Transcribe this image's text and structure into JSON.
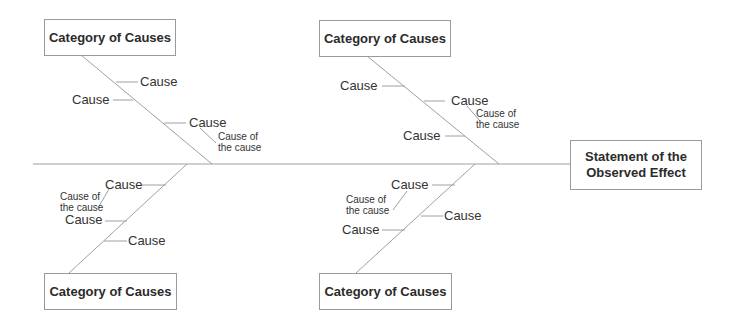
{
  "diagram": {
    "type": "fishbone",
    "effect": {
      "line1": "Statement of the",
      "line2": "Observed Effect"
    },
    "categories": [
      {
        "position": "top-left",
        "label": "Category of Causes",
        "causes": [
          "Cause",
          "Cause",
          "Cause"
        ],
        "sub_cause": {
          "line1": "Cause of",
          "line2": "the cause"
        }
      },
      {
        "position": "top-right",
        "label": "Category of Causes",
        "causes": [
          "Cause",
          "Cause",
          "Cause"
        ],
        "sub_cause": {
          "line1": "Cause of",
          "line2": "the cause"
        }
      },
      {
        "position": "bottom-left",
        "label": "Category of Causes",
        "causes": [
          "Cause",
          "Cause",
          "Cause"
        ],
        "sub_cause": {
          "line1": "Cause of",
          "line2": "the cause"
        }
      },
      {
        "position": "bottom-right",
        "label": "Category of Causes",
        "causes": [
          "Cause",
          "Cause",
          "Cause"
        ],
        "sub_cause": {
          "line1": "Cause of",
          "line2": "the cause"
        }
      }
    ],
    "colors": {
      "line": "#9a9a9a",
      "text": "#2b2b2b",
      "background": "#ffffff"
    }
  }
}
